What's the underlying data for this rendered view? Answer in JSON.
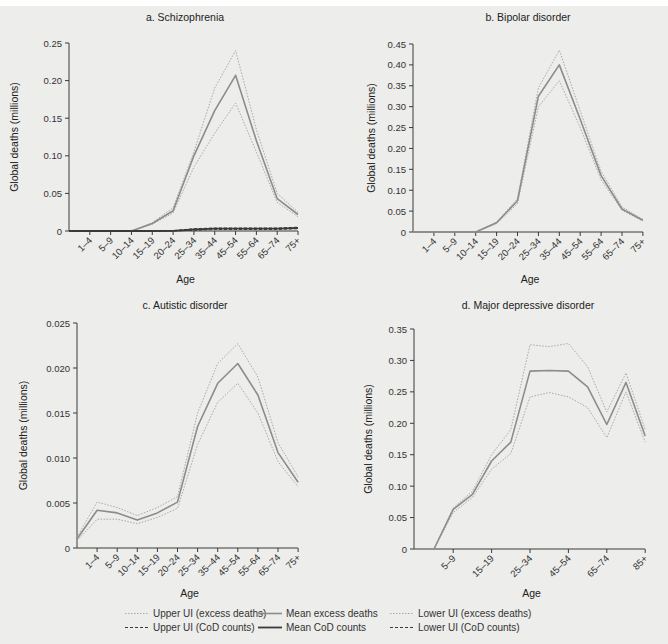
{
  "legend": {
    "items": [
      {
        "label": "Upper UI (excess deaths)",
        "style": "upper-excess"
      },
      {
        "label": "Mean excess deaths",
        "style": "mean-excess"
      },
      {
        "label": "Lower UI (excess deaths)",
        "style": "lower-excess"
      },
      {
        "label": "Upper UI (CoD counts)",
        "style": "upper-cod"
      },
      {
        "label": "Mean CoD counts",
        "style": "mean-cod"
      },
      {
        "label": "Lower UI (CoD counts)",
        "style": "lower-cod"
      }
    ]
  },
  "colors": {
    "excess_mean": "#8c8c8c",
    "excess_ui": "#a8a8a8",
    "cod_mean": "#3a3a3a",
    "cod_ui": "#3a3a3a",
    "background": "#ededeb",
    "axis": "#3a3a3a"
  },
  "chart_data": [
    {
      "type": "line",
      "title": "a. Schizophrenia",
      "xlabel": "Age",
      "ylabel": "Global deaths (millions)",
      "ylim": [
        0,
        0.25
      ],
      "yticks": [
        "0",
        "0.05",
        "0.10",
        "0.15",
        "0.20",
        "0.25"
      ],
      "categories": [
        "<1",
        "1–4",
        "5–9",
        "10–14",
        "15–19",
        "20–24",
        "25–34",
        "35–44",
        "45–54",
        "55–64",
        "65–74",
        "75+"
      ],
      "tick_labels": [
        "1–4",
        "5–9",
        "10–14",
        "15–19",
        "20–24",
        "25–34",
        "35–44",
        "45–54",
        "55–64",
        "65–74",
        "75+"
      ],
      "series": [
        {
          "name": "Upper UI (excess deaths)",
          "values": [
            0,
            0,
            0,
            0,
            0.011,
            0.031,
            0.105,
            0.19,
            0.24,
            0.135,
            0.05,
            0.025
          ]
        },
        {
          "name": "Mean excess deaths",
          "values": [
            0,
            0,
            0,
            0,
            0.01,
            0.027,
            0.1,
            0.16,
            0.207,
            0.12,
            0.043,
            0.022
          ]
        },
        {
          "name": "Lower UI (excess deaths)",
          "values": [
            0,
            0,
            0,
            0,
            0.009,
            0.024,
            0.085,
            0.13,
            0.17,
            0.105,
            0.038,
            0.019
          ]
        },
        {
          "name": "Upper UI (CoD counts)",
          "values": [
            0,
            0,
            0,
            0,
            0,
            0.0005,
            0.003,
            0.004,
            0.004,
            0.004,
            0.004,
            0.005
          ]
        },
        {
          "name": "Mean CoD counts",
          "values": [
            0,
            0,
            0,
            0,
            0,
            0.0003,
            0.002,
            0.003,
            0.003,
            0.003,
            0.003,
            0.004
          ]
        },
        {
          "name": "Lower UI (CoD counts)",
          "values": [
            0,
            0,
            0,
            0,
            0,
            0.0001,
            0.001,
            0.002,
            0.002,
            0.002,
            0.002,
            0.003
          ]
        }
      ]
    },
    {
      "type": "line",
      "title": "b. Bipolar disorder",
      "xlabel": "Age",
      "ylabel": "Global deaths (millions)",
      "ylim": [
        0,
        0.45
      ],
      "yticks": [
        "0",
        "0.05",
        "0.10",
        "0.15",
        "0.20",
        "0.25",
        "0.30",
        "0.35",
        "0.40",
        "0.45"
      ],
      "categories": [
        "<1",
        "1–4",
        "5–9",
        "10–14",
        "15–19",
        "20–24",
        "25–34",
        "35–44",
        "45–54",
        "55–64",
        "65–74",
        "75+"
      ],
      "tick_labels": [
        "1–4",
        "5–9",
        "10–14",
        "15–19",
        "20–24",
        "25–34",
        "35–44",
        "45–54",
        "55–64",
        "65–74",
        "75+"
      ],
      "series": [
        {
          "name": "Upper UI (excess deaths)",
          "values": [
            0,
            0,
            0,
            0,
            0.024,
            0.08,
            0.345,
            0.435,
            0.29,
            0.145,
            0.06,
            0.03
          ]
        },
        {
          "name": "Mean excess deaths",
          "values": [
            0,
            0,
            0,
            0,
            0.022,
            0.075,
            0.325,
            0.4,
            0.27,
            0.135,
            0.055,
            0.028
          ]
        },
        {
          "name": "Lower UI (excess deaths)",
          "values": [
            0,
            0,
            0,
            0,
            0.02,
            0.068,
            0.3,
            0.362,
            0.25,
            0.125,
            0.052,
            0.026
          ]
        }
      ]
    },
    {
      "type": "line",
      "title": "c. Autistic disorder",
      "xlabel": "Age",
      "ylabel": "Global deaths (millions)",
      "ylim": [
        0,
        0.025
      ],
      "yticks": [
        "0",
        "0.005",
        "0.010",
        "0.015",
        "0.020",
        "0.025"
      ],
      "categories": [
        "<1",
        "1–4",
        "5–9",
        "10–14",
        "15–19",
        "20–24",
        "25–34",
        "35–44",
        "45–54",
        "55–64",
        "65–74",
        "75+"
      ],
      "tick_labels": [
        "1–4",
        "5–9",
        "10–14",
        "15–19",
        "20–24",
        "25–34",
        "35–44",
        "45–54",
        "55–64",
        "65–74",
        "75+"
      ],
      "series": [
        {
          "name": "Upper UI (excess deaths)",
          "values": [
            0.0012,
            0.0051,
            0.0045,
            0.0036,
            0.0045,
            0.0057,
            0.015,
            0.0205,
            0.0227,
            0.019,
            0.0117,
            0.0079
          ]
        },
        {
          "name": "Mean excess deaths",
          "values": [
            0.001,
            0.0042,
            0.0039,
            0.0031,
            0.0039,
            0.0051,
            0.0135,
            0.0183,
            0.0205,
            0.017,
            0.0106,
            0.0073
          ]
        },
        {
          "name": "Lower UI (excess deaths)",
          "values": [
            0.0008,
            0.0032,
            0.0032,
            0.0027,
            0.0034,
            0.0044,
            0.0115,
            0.0162,
            0.0183,
            0.015,
            0.0096,
            0.0068
          ]
        }
      ]
    },
    {
      "type": "line",
      "title": "d. Major depressive disorder",
      "xlabel": "Age",
      "ylabel": "Global deaths (millions)",
      "ylim": [
        0,
        0.35
      ],
      "yticks": [
        "0",
        "0.05",
        "0.10",
        "0.15",
        "0.20",
        "0.25",
        "0.30",
        "0.35"
      ],
      "categories": [
        "1–4",
        "5–9",
        "10–14",
        "15–19",
        "20–24",
        "25–34",
        "35–44",
        "45–54",
        "55–64",
        "65–74",
        "75–84",
        "85+"
      ],
      "tick_labels": [
        "5–9",
        "15–19",
        "25–34",
        "45–54",
        "65–74",
        "85+"
      ],
      "series": [
        {
          "name": "Upper UI (excess deaths)",
          "values": [
            0,
            0.065,
            0.092,
            0.15,
            0.19,
            0.325,
            0.322,
            0.327,
            0.29,
            0.218,
            0.28,
            0.19
          ]
        },
        {
          "name": "Mean excess deaths",
          "values": [
            0,
            0.063,
            0.087,
            0.14,
            0.17,
            0.283,
            0.284,
            0.283,
            0.258,
            0.198,
            0.265,
            0.18
          ]
        },
        {
          "name": "Lower UI (excess deaths)",
          "values": [
            0,
            0.058,
            0.082,
            0.127,
            0.152,
            0.242,
            0.249,
            0.242,
            0.225,
            0.177,
            0.25,
            0.17
          ]
        }
      ]
    }
  ]
}
